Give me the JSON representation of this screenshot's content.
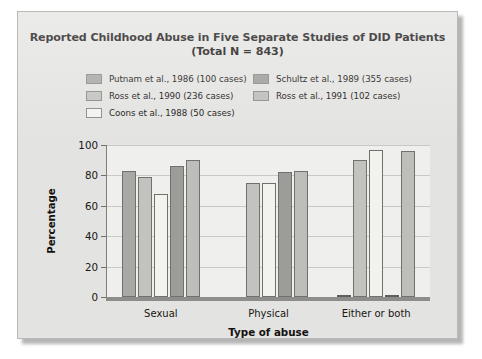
{
  "figure": {
    "title_line1": "Reported Childhood Abuse in Five Separate Studies of DID Patients",
    "title_line2": "(Total N = 843)"
  },
  "chart_data": {
    "type": "bar",
    "title": "Reported Childhood Abuse in Five Separate Studies of DID Patients (Total N = 843)",
    "xlabel": "Type of abuse",
    "ylabel": "Percentage",
    "ylim": [
      0,
      100
    ],
    "yticks": [
      0,
      20,
      40,
      60,
      80,
      100
    ],
    "ytick_labels": [
      "0",
      "20",
      "40",
      "60",
      "80",
      "100"
    ],
    "grid": true,
    "legend_position": "above-plot",
    "categories": [
      "Sexual",
      "Physical",
      "Either or both"
    ],
    "series": [
      {
        "name": "Putnam et al., 1986 (100 cases)",
        "color": "#a8a8a4",
        "values": [
          83,
          0,
          1
        ]
      },
      {
        "name": "Ross et al., 1990 (236 cases)",
        "color": "#c2c2be",
        "values": [
          79,
          75,
          90
        ]
      },
      {
        "name": "Coons et al., 1988 (50 cases)",
        "color": "#f2f2ef",
        "values": [
          68,
          75,
          97
        ]
      },
      {
        "name": "Schultz et al., 1989 (355 cases)",
        "color": "#9c9c98",
        "values": [
          86,
          82,
          1
        ]
      },
      {
        "name": "Ross et al., 1991 (102 cases)",
        "color": "#bdbdb9",
        "values": [
          90,
          83,
          96
        ]
      }
    ]
  }
}
